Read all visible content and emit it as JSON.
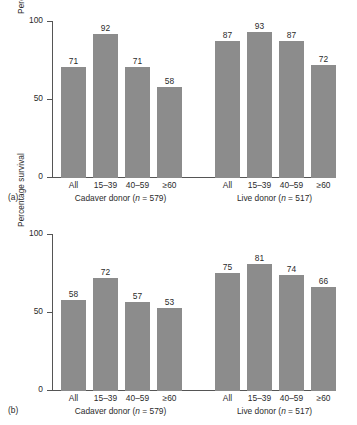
{
  "figure": {
    "ylabel": "Percentage survival",
    "ytick_labels": [
      "0",
      "50",
      "100"
    ]
  },
  "chart_data": {
    "type": "bar",
    "title": "",
    "xlabel": "",
    "ylabel": "Percentage survival",
    "ylim": [
      0,
      100
    ],
    "yticks": [
      0,
      50,
      100
    ],
    "grid": false,
    "legend": "none",
    "panels": [
      {
        "panel_label": "(a)",
        "groups": [
          {
            "name": "Cadaver donor",
            "caption_prefix": "Cadaver donor (",
            "caption_n": "n",
            "caption_suffix": " = 579)",
            "n": 579,
            "categories": [
              "All",
              "15–39",
              "40–59",
              "≥60"
            ],
            "values": [
              71,
              92,
              71,
              58
            ]
          },
          {
            "name": "Live donor",
            "caption_prefix": "Live donor (",
            "caption_n": "n",
            "caption_suffix": " = 517)",
            "n": 517,
            "categories": [
              "All",
              "15–39",
              "40–59",
              "≥60"
            ],
            "values": [
              87,
              93,
              87,
              72
            ]
          }
        ]
      },
      {
        "panel_label": "(b)",
        "groups": [
          {
            "name": "Cadaver donor",
            "caption_prefix": "Cadaver donor (",
            "caption_n": "n",
            "caption_suffix": " = 579)",
            "n": 579,
            "categories": [
              "All",
              "15–39",
              "40–59",
              "≥60"
            ],
            "values": [
              58,
              72,
              57,
              53
            ]
          },
          {
            "name": "Live donor",
            "caption_prefix": "Live donor (",
            "caption_n": "n",
            "caption_suffix": " = 517)",
            "n": 517,
            "categories": [
              "All",
              "15–39",
              "40–59",
              "≥60"
            ],
            "values": [
              75,
              81,
              74,
              66
            ]
          }
        ]
      }
    ],
    "colors": {
      "bar": "#8c8c8c",
      "axis": "#555555",
      "text": "#2b2b2b",
      "background": "#ffffff"
    }
  }
}
